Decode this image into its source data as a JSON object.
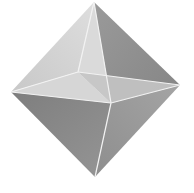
{
  "image": {
    "subject": "octahedron",
    "background": "#ffffff",
    "vertices": {
      "top": [
        94,
        2
      ],
      "left": [
        11,
        92
      ],
      "right": [
        180,
        85
      ],
      "bottom": [
        95,
        177
      ],
      "back": [
        78,
        72
      ],
      "front": [
        111,
        103
      ]
    },
    "faces": [
      {
        "name": "top-left-back",
        "points": "94,2 11,92 78,72",
        "fill": "#d4d4d4"
      },
      {
        "name": "top-right-back",
        "points": "94,2 78,72 180,85",
        "fill": "#e2e2e2"
      },
      {
        "name": "top-right",
        "points": "94,2 180,85 111,103",
        "fill": "#8e8e8e"
      },
      {
        "name": "top-left-front",
        "points": "94,2 111,103 78,72",
        "fill": "#dcdcdc"
      },
      {
        "name": "upper-left",
        "points": "11,92 78,72 111,103",
        "fill": "#cfcfcf"
      },
      {
        "name": "upper-right",
        "points": "78,72 180,85 111,103",
        "fill": "#c9c9c9"
      },
      {
        "name": "bottom-left",
        "points": "11,92 111,103 95,177",
        "fill": "#8a8a8a"
      },
      {
        "name": "bottom-right",
        "points": "111,103 180,85 95,177",
        "fill": "#9a9a9a"
      }
    ],
    "edge_color": "#f0f0f0"
  }
}
